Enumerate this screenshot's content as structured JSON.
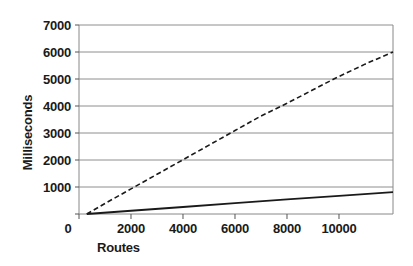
{
  "chart_data": {
    "type": "line",
    "title": "",
    "xlabel": "Routes",
    "ylabel": "Milliseconds",
    "xlim": [
      0,
      12077
    ],
    "ylim": [
      0,
      7000
    ],
    "xticks": [
      0,
      2000,
      4000,
      6000,
      8000,
      10000
    ],
    "yticks": [
      0,
      1000,
      2000,
      3000,
      4000,
      5000,
      6000,
      7000
    ],
    "grid": "horizontal",
    "legend": "none",
    "series": [
      {
        "name": "dashed-series",
        "style": "dashed",
        "color": "#1a1a1a",
        "points": [
          {
            "x": 300,
            "y": 0
          },
          {
            "x": 1000,
            "y": 390
          },
          {
            "x": 2000,
            "y": 930
          },
          {
            "x": 3000,
            "y": 1470
          },
          {
            "x": 4000,
            "y": 2010
          },
          {
            "x": 5000,
            "y": 2550
          },
          {
            "x": 6000,
            "y": 3090
          },
          {
            "x": 7000,
            "y": 3630
          },
          {
            "x": 8000,
            "y": 4100
          },
          {
            "x": 9000,
            "y": 4600
          },
          {
            "x": 9800,
            "y": 5000
          },
          {
            "x": 11000,
            "y": 5550
          },
          {
            "x": 12077,
            "y": 6000
          }
        ]
      },
      {
        "name": "solid-series",
        "style": "solid",
        "color": "#1a1a1a",
        "points": [
          {
            "x": 300,
            "y": 0
          },
          {
            "x": 2000,
            "y": 120
          },
          {
            "x": 4000,
            "y": 260
          },
          {
            "x": 6000,
            "y": 400
          },
          {
            "x": 8000,
            "y": 540
          },
          {
            "x": 10000,
            "y": 670
          },
          {
            "x": 12077,
            "y": 810
          }
        ]
      }
    ],
    "ytick_labels": [
      "0",
      "1000",
      "2000",
      "3000",
      "4000",
      "5000",
      "6000",
      "7000"
    ],
    "xtick_labels": [
      "0",
      "2000",
      "4000",
      "6000",
      "8000",
      "10000"
    ]
  },
  "axes": {
    "x_title": "Routes",
    "y_title": "Milliseconds"
  }
}
